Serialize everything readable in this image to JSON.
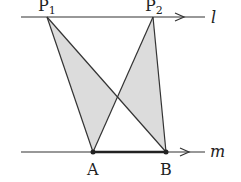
{
  "diagram": {
    "lines": [
      {
        "name": "l",
        "label": "l",
        "y": 17,
        "x_start": 21,
        "x_end": 205
      },
      {
        "name": "m",
        "label": "m",
        "y": 152,
        "x_start": 21,
        "x_end": 205
      }
    ],
    "points": {
      "P1": {
        "label": "P",
        "sub": "1",
        "x": 47,
        "y": 17
      },
      "P2": {
        "label": "P",
        "sub": "2",
        "x": 153,
        "y": 17
      },
      "A": {
        "label": "A",
        "x": 93,
        "y": 152
      },
      "B": {
        "label": "B",
        "x": 166,
        "y": 152
      }
    },
    "triangles": [
      "P1AB",
      "P2AB"
    ],
    "segment_highlight": "AB",
    "colors": {
      "fill": "#dcdcdc",
      "stroke": "#333333"
    }
  }
}
